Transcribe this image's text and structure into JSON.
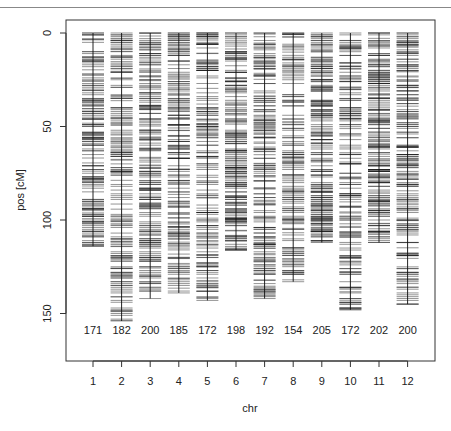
{
  "chart_data": {
    "type": "genetic-map",
    "title": "",
    "xlabel": "chr",
    "ylabel": "pos [cM]",
    "ylim": [
      0,
      175
    ],
    "y_reversed": true,
    "y_ticks": [
      0,
      50,
      100,
      150
    ],
    "categories": [
      "1",
      "2",
      "3",
      "4",
      "5",
      "6",
      "7",
      "8",
      "9",
      "10",
      "11",
      "12"
    ],
    "marker_counts": [
      171,
      182,
      200,
      185,
      172,
      198,
      192,
      154,
      205,
      172,
      202,
      200
    ],
    "chromosome_lengths_cM": [
      114,
      154,
      142,
      139,
      143,
      116,
      142,
      133,
      112,
      148,
      112,
      145
    ],
    "grid": false,
    "legend": "none"
  },
  "axis": {
    "x_title": "chr",
    "y_title": "pos [cM]"
  }
}
